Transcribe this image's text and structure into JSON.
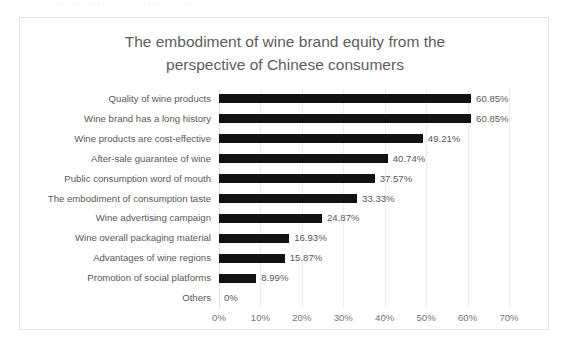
{
  "scan_artifact_text": "· · · · · · · · · · · · · · · · · · · · · · · · · · · · · · · · · · · · · · ·",
  "chart": {
    "title_line1": "The embodiment of wine brand equity from the",
    "title_line2": "perspective of Chinese consumers"
  },
  "chart_data": {
    "type": "bar",
    "orientation": "horizontal",
    "title": "The embodiment of wine brand equity from the perspective of Chinese consumers",
    "xlabel": "",
    "ylabel": "",
    "xlim": [
      0,
      70
    ],
    "grid": true,
    "legend": false,
    "bar_color": "#121212",
    "tick_labels": [
      "0%",
      "10%",
      "20%",
      "30%",
      "40%",
      "50%",
      "60%",
      "70%"
    ],
    "tick_values": [
      0,
      10,
      20,
      30,
      40,
      50,
      60,
      70
    ],
    "categories": [
      "Quality of wine products",
      "Wine brand has a long history",
      "Wine products are cost-effective",
      "After-sale guarantee of wine",
      "Public consumption word of mouth",
      "The embodiment of consumption taste",
      "Wine advertising campaign",
      "Wine overall packaging material",
      "Advantages of wine regions",
      "Promotion of social platforms",
      "Others"
    ],
    "values": [
      60.85,
      60.85,
      49.21,
      40.74,
      37.57,
      33.33,
      24.87,
      16.93,
      15.87,
      8.99,
      0
    ],
    "value_labels": [
      "60.85%",
      "60.85%",
      "49.21%",
      "40.74%",
      "37.57%",
      "33.33%",
      "24.87%",
      "16.93%",
      "15.87%",
      "8.99%",
      "0%"
    ]
  }
}
